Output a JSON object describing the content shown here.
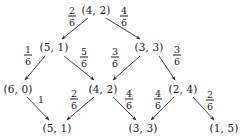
{
  "diagram": {
    "line_color": "#2b2b2b",
    "text_color": "#1a1a1a",
    "background": "#ffffff",
    "nodes": [
      {
        "id": "n0",
        "label": "(4, 2)",
        "x": 96,
        "y": 10,
        "row": 0
      },
      {
        "id": "n1",
        "label": "(5, 1)",
        "x": 54,
        "y": 47,
        "row": 1
      },
      {
        "id": "n2",
        "label": "(3, 3)",
        "x": 149,
        "y": 47,
        "row": 1
      },
      {
        "id": "n3",
        "label": "(6, 0)",
        "x": 18,
        "y": 89,
        "row": 2
      },
      {
        "id": "n4",
        "label": "(4, 2)",
        "x": 103,
        "y": 89,
        "row": 2
      },
      {
        "id": "n5",
        "label": "(2, 4)",
        "x": 183,
        "y": 89,
        "row": 2
      },
      {
        "id": "n6",
        "label": "(5, 1)",
        "x": 57,
        "y": 128,
        "row": 3
      },
      {
        "id": "n7",
        "label": "(3, 3)",
        "x": 143,
        "y": 128,
        "row": 3
      },
      {
        "id": "n8",
        "label": "(1, 5)",
        "x": 224,
        "y": 128,
        "row": 3
      }
    ],
    "edges": [
      {
        "from": "n0",
        "to": "n1",
        "x1": 88,
        "y1": 18,
        "x2": 62,
        "y2": 39,
        "label": {
          "num": "2",
          "den": "6",
          "x": 72,
          "y": 16
        }
      },
      {
        "from": "n0",
        "to": "n2",
        "x1": 106,
        "y1": 18,
        "x2": 140,
        "y2": 39,
        "label": {
          "num": "4",
          "den": "6",
          "x": 124,
          "y": 16
        }
      },
      {
        "from": "n1",
        "to": "n3",
        "x1": 45,
        "y1": 56,
        "x2": 25,
        "y2": 80,
        "label": {
          "num": "1",
          "den": "6",
          "x": 28,
          "y": 55
        }
      },
      {
        "from": "n1",
        "to": "n4",
        "x1": 64,
        "y1": 56,
        "x2": 94,
        "y2": 80,
        "label": {
          "num": "5",
          "den": "6",
          "x": 84,
          "y": 57
        }
      },
      {
        "from": "n2",
        "to": "n4",
        "x1": 140,
        "y1": 56,
        "x2": 113,
        "y2": 80,
        "label": {
          "num": "3",
          "den": "6",
          "x": 115,
          "y": 57
        }
      },
      {
        "from": "n2",
        "to": "n5",
        "x1": 159,
        "y1": 56,
        "x2": 175,
        "y2": 80,
        "label": {
          "num": "3",
          "den": "6",
          "x": 177,
          "y": 55
        }
      },
      {
        "from": "n3",
        "to": "n6",
        "x1": 27,
        "y1": 97,
        "x2": 49,
        "y2": 120,
        "label": {
          "num": "1",
          "den": "",
          "x": 41,
          "y": 100
        }
      },
      {
        "from": "n4",
        "to": "n6",
        "x1": 94,
        "y1": 97,
        "x2": 67,
        "y2": 120,
        "label": {
          "num": "2",
          "den": "6",
          "x": 74,
          "y": 99
        }
      },
      {
        "from": "n4",
        "to": "n7",
        "x1": 113,
        "y1": 97,
        "x2": 136,
        "y2": 120,
        "label": {
          "num": "4",
          "den": "6",
          "x": 129,
          "y": 99
        }
      },
      {
        "from": "n5",
        "to": "n7",
        "x1": 174,
        "y1": 97,
        "x2": 151,
        "y2": 120,
        "label": {
          "num": "4",
          "den": "6",
          "x": 158,
          "y": 99
        }
      },
      {
        "from": "n5",
        "to": "n8",
        "x1": 193,
        "y1": 97,
        "x2": 214,
        "y2": 120,
        "label": {
          "num": "2",
          "den": "6",
          "x": 210,
          "y": 100
        }
      }
    ]
  }
}
